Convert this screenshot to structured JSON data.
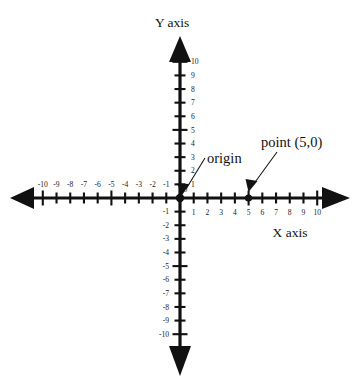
{
  "figure": {
    "background_color": "#ffffff",
    "ink_color": "#111111"
  },
  "chart_data": {
    "type": "scatter",
    "title": "",
    "xlabel": "X axis",
    "ylabel": "Y axis",
    "xlim": [
      -10,
      10
    ],
    "ylim": [
      -10,
      10
    ],
    "grid": false,
    "legend": null,
    "x_ticks": [
      -10,
      -9,
      -8,
      -7,
      -6,
      -5,
      -4,
      -3,
      -2,
      -1,
      1,
      2,
      3,
      4,
      5,
      6,
      7,
      8,
      9,
      10
    ],
    "x_tick_labels": [
      "-10",
      "-9",
      "-8",
      "-7",
      "-6",
      "-5",
      "-4",
      "-3",
      "-2",
      "-1",
      "1",
      "2",
      "3",
      "4",
      "5",
      "6",
      "7",
      "8",
      "9",
      "10"
    ],
    "y_ticks": [
      -10,
      -9,
      -8,
      -7,
      -6,
      -5,
      -4,
      -3,
      -2,
      -1,
      1,
      2,
      3,
      4,
      5,
      6,
      7,
      8,
      9,
      10
    ],
    "y_tick_labels": [
      "-10",
      "-9",
      "-8",
      "-7",
      "-6",
      "-5",
      "-4",
      "-3",
      "-2",
      "-1",
      "1",
      "2",
      "3",
      "4",
      "5",
      "6",
      "7",
      "8",
      "9",
      "10"
    ],
    "points": [
      {
        "name": "origin",
        "x": 0,
        "y": 0,
        "label": "origin"
      },
      {
        "name": "point-5-0",
        "x": 5,
        "y": 0,
        "label": "point (5,0)"
      }
    ],
    "series": [
      {
        "name": "marked points",
        "x": [
          0,
          5
        ],
        "y": [
          0,
          0
        ]
      }
    ],
    "annotations": [
      {
        "name": "origin-annotation",
        "text": "origin",
        "points_to": {
          "x": 0,
          "y": 0
        }
      },
      {
        "name": "point-annotation",
        "text": "point (5,0)",
        "points_to": {
          "x": 5,
          "y": 0
        }
      }
    ]
  },
  "labels": {
    "y_axis_title": "Y axis",
    "x_axis_title": "X axis",
    "origin_annotation": "origin",
    "point_annotation": "point (5,0)",
    "zero_label": "0"
  },
  "ticks": {
    "x_negative": [
      "-10",
      "-9",
      "-8",
      "-7",
      "-6",
      "-5",
      "-4",
      "-3",
      "-2",
      "-1"
    ],
    "x_positive": [
      "1",
      "2",
      "3",
      "4",
      "5",
      "6",
      "7",
      "8",
      "9",
      "10"
    ],
    "y_positive": [
      "1",
      "2",
      "3",
      "4",
      "5",
      "6",
      "7",
      "8",
      "9",
      "10"
    ],
    "y_negative": [
      "-1",
      "-2",
      "-3",
      "-4",
      "-5",
      "-6",
      "-7",
      "-8",
      "-9",
      "-10"
    ]
  }
}
